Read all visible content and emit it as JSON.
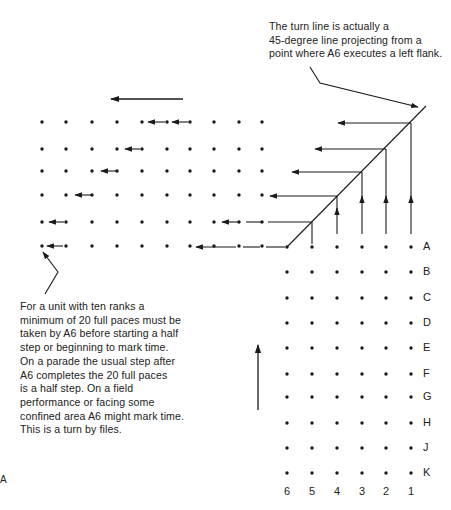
{
  "annotations": {
    "top_note": [
      "The turn line is actually a",
      "45-degree line projecting from a",
      "point where A6 executes a left flank."
    ],
    "bottom_note": [
      "For a unit with ten ranks a",
      "minimum of 20 full paces must be",
      "taken by A6 before starting a half",
      "step or beginning to mark time.",
      "On a parade the usual step after",
      "A6 completes the 20 full paces",
      "is a half step. On a field",
      "performance or facing some",
      "confined area A6 might mark time.",
      "This is a turn by files."
    ]
  },
  "rank_labels": [
    "A",
    "B",
    "C",
    "D",
    "E",
    "F",
    "G",
    "H",
    "J",
    "K"
  ],
  "file_labels": [
    "6",
    "5",
    "4",
    "3",
    "2",
    "1"
  ],
  "corner_artifact": "A",
  "colors": {
    "ink": "#1a1a1a",
    "background": "#ffffff"
  }
}
